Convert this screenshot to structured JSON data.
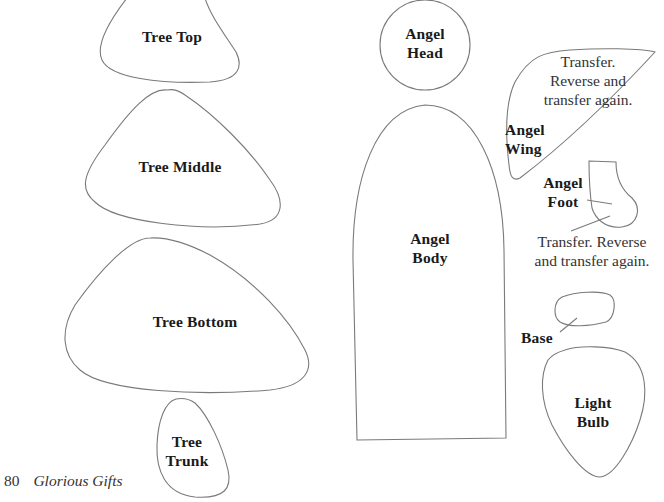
{
  "pieces": {
    "tree_top": {
      "label": "Tree Top"
    },
    "tree_middle": {
      "label": "Tree Middle"
    },
    "tree_bottom": {
      "label": "Tree Bottom"
    },
    "tree_trunk": {
      "line1": "Tree",
      "line2": "Trunk"
    },
    "angel_head": {
      "line1": "Angel",
      "line2": "Head"
    },
    "angel_body": {
      "line1": "Angel",
      "line2": "Body"
    },
    "angel_wing": {
      "line1": "Angel",
      "line2": "Wing",
      "note_line1": "Transfer.",
      "note_line2": "Reverse and",
      "note_line3": "transfer again."
    },
    "angel_foot": {
      "line1": "Angel",
      "line2": "Foot",
      "note_line1": "Transfer. Reverse",
      "note_line2": "and transfer again."
    },
    "base": {
      "label": "Base"
    },
    "light_bulb": {
      "line1": "Light",
      "line2": "Bulb"
    }
  },
  "footer": {
    "page_number": "80",
    "book_title": "Glorious Gifts"
  },
  "colors": {
    "outline": "#7a7a7a",
    "text": "#1a1a1a",
    "background": "#ffffff"
  }
}
